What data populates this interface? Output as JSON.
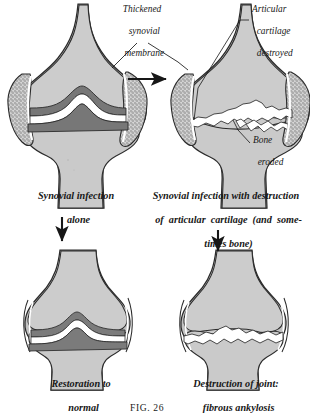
{
  "figure": {
    "number_label": "FIG.  26",
    "title_implied": "Synovial joint infection outcomes"
  },
  "callouts": [
    {
      "id": "thickened-synovial-membrane",
      "lines": [
        "Thickened",
        "synovial",
        "membrane"
      ],
      "x": 96,
      "y": 4,
      "width": 92,
      "align": "center"
    },
    {
      "id": "articular-cartilage-destroyed",
      "lines": [
        "Articular",
        "cartilage",
        "destroyed"
      ],
      "x": 252,
      "y": 4,
      "width": 58,
      "align": "left"
    },
    {
      "id": "bone-eroded",
      "lines": [
        "Bone",
        "eroded"
      ],
      "x": 253,
      "y": 135,
      "width": 56,
      "align": "left"
    }
  ],
  "panels": [
    {
      "id": "panel-top-left",
      "state": "synovial-infection-alone",
      "caption_lines": [
        "Synovial infection",
        "alone"
      ],
      "caption_x": 6,
      "caption_y": 190,
      "caption_width": 140,
      "features": [
        "thickened stippled synovial membrane",
        "intact dark articular cartilage",
        "preserved joint space"
      ]
    },
    {
      "id": "panel-top-right",
      "state": "synovial-infection-with-destruction",
      "caption_lines": [
        "Synovial infection with destruction",
        "of  articular  cartilage  (and  some-",
        "times bone)"
      ],
      "caption_x": 142,
      "caption_y": 190,
      "caption_width": 168,
      "features": [
        "articular cartilage destroyed",
        "bone eroded",
        "irregular joint surfaces"
      ]
    },
    {
      "id": "panel-bottom-left",
      "state": "restoration-to-normal",
      "caption_lines": [
        "Restoration to",
        "normal"
      ],
      "caption_x": 18,
      "caption_y": 378,
      "caption_width": 126,
      "features": [
        "normal cartilage restored",
        "normal joint space",
        "no synovial thickening"
      ]
    },
    {
      "id": "panel-bottom-right",
      "state": "fibrous-ankylosis",
      "caption_lines": [
        "Destruction of joint:",
        "fibrous ankylosis"
      ],
      "caption_x": 166,
      "caption_y": 378,
      "caption_width": 140,
      "features": [
        "joint space obliterated",
        "bones fused by fibrous tissue",
        "irregular fusion line"
      ]
    }
  ],
  "arrows": [
    {
      "id": "arrow-top-left-to-top-right",
      "direction": "right",
      "from_panel": "panel-top-left",
      "to_panel": "panel-top-right"
    },
    {
      "id": "arrow-top-left-to-bottom-left",
      "direction": "down",
      "from_panel": "panel-top-left",
      "to_panel": "panel-bottom-left"
    },
    {
      "id": "arrow-top-right-to-bottom-right",
      "direction": "down",
      "from_panel": "panel-top-right",
      "to_panel": "panel-bottom-right"
    }
  ],
  "colors": {
    "background": "#ffffff",
    "ink": "#1a1a1a",
    "bone_fill": "#c9c9c9",
    "bone_fill_light": "#d2d2d2",
    "cartilage_dark": "#6e6e6e",
    "synovium_stipple": "#9a9a9a",
    "joint_space": "#ffffff",
    "outline": "#2b2b2b"
  }
}
